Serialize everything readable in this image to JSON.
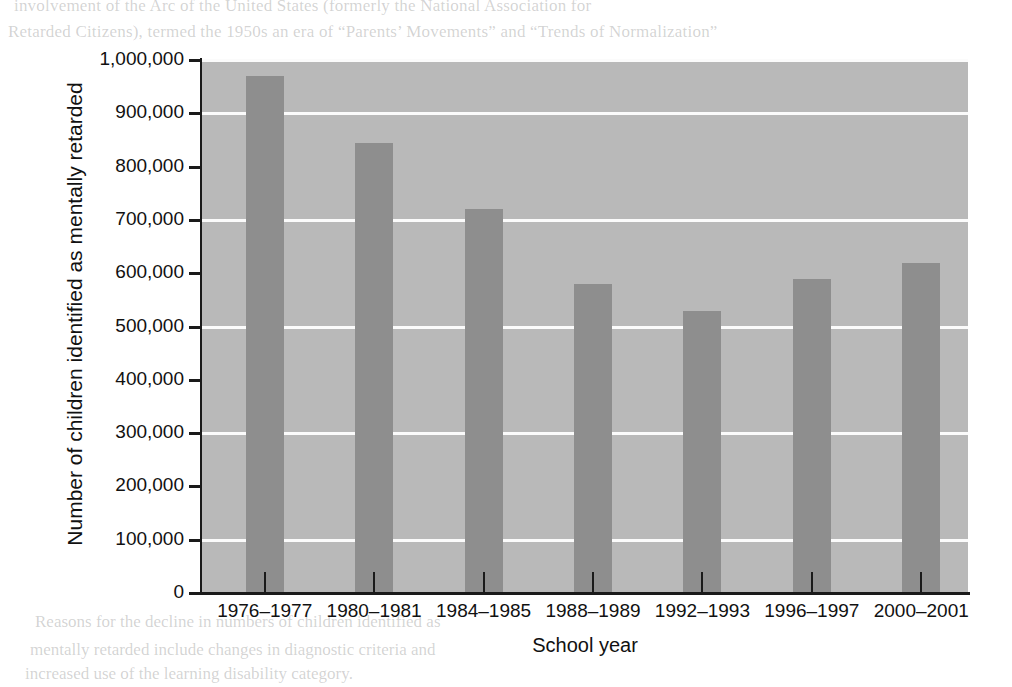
{
  "chart_data": {
    "type": "bar",
    "title": "",
    "xlabel": "School year",
    "ylabel": "Number of children identified as mentally retarded",
    "categories": [
      "1976–1977",
      "1980–1981",
      "1984–1985",
      "1988–1989",
      "1992–1993",
      "1996–1997",
      "2000–2001"
    ],
    "values": [
      970000,
      845000,
      720000,
      580000,
      530000,
      590000,
      620000
    ],
    "ylim": [
      0,
      1000000
    ],
    "ytick_values": [
      0,
      100000,
      200000,
      300000,
      400000,
      500000,
      600000,
      700000,
      800000,
      900000,
      1000000
    ],
    "ytick_labels": [
      "0",
      "100,000",
      "200,000",
      "300,000",
      "400,000",
      "500,000",
      "600,000",
      "700,000",
      "800,000",
      "900,000",
      "1,000,000"
    ],
    "gridlines_at": [
      100000,
      300000,
      500000,
      700000,
      900000,
      1000000
    ],
    "grid": true,
    "legend": "none",
    "colors": {
      "bar": "#8e8e8e",
      "plot_background": "#b9b9b9",
      "gridline": "#fbfbfb",
      "axis": "#1a1a1a",
      "text": "#111111",
      "page_background": "#ffffff"
    }
  },
  "background_text": {
    "top_line_1": "involvement of the Arc of the United States (formerly the National Association for",
    "top_line_2": "Retarded Citizens), termed the 1950s an era of “Parents’ Movements” and “Trends of Normalization”",
    "right_lines": [
      "movement. Categorical and specific",
      "public policy and the law.",
      "",
      "The steady increase in",
      "students served in this category",
      "continued to increase",
      "",
      "Cultural and linguistic",
      "diversity of students with",
      "disabilities. The proportion",
      "of students from diverse",
      "backgrounds identified as",
      "needing special education",
      "services has increased",
      "over the years."
    ],
    "bottom_lines": [
      "Reasons for the decline in numbers of children identified as",
      "mentally retarded include changes in diagnostic criteria and",
      "increased use of the learning disability category."
    ],
    "left_line": "and"
  }
}
